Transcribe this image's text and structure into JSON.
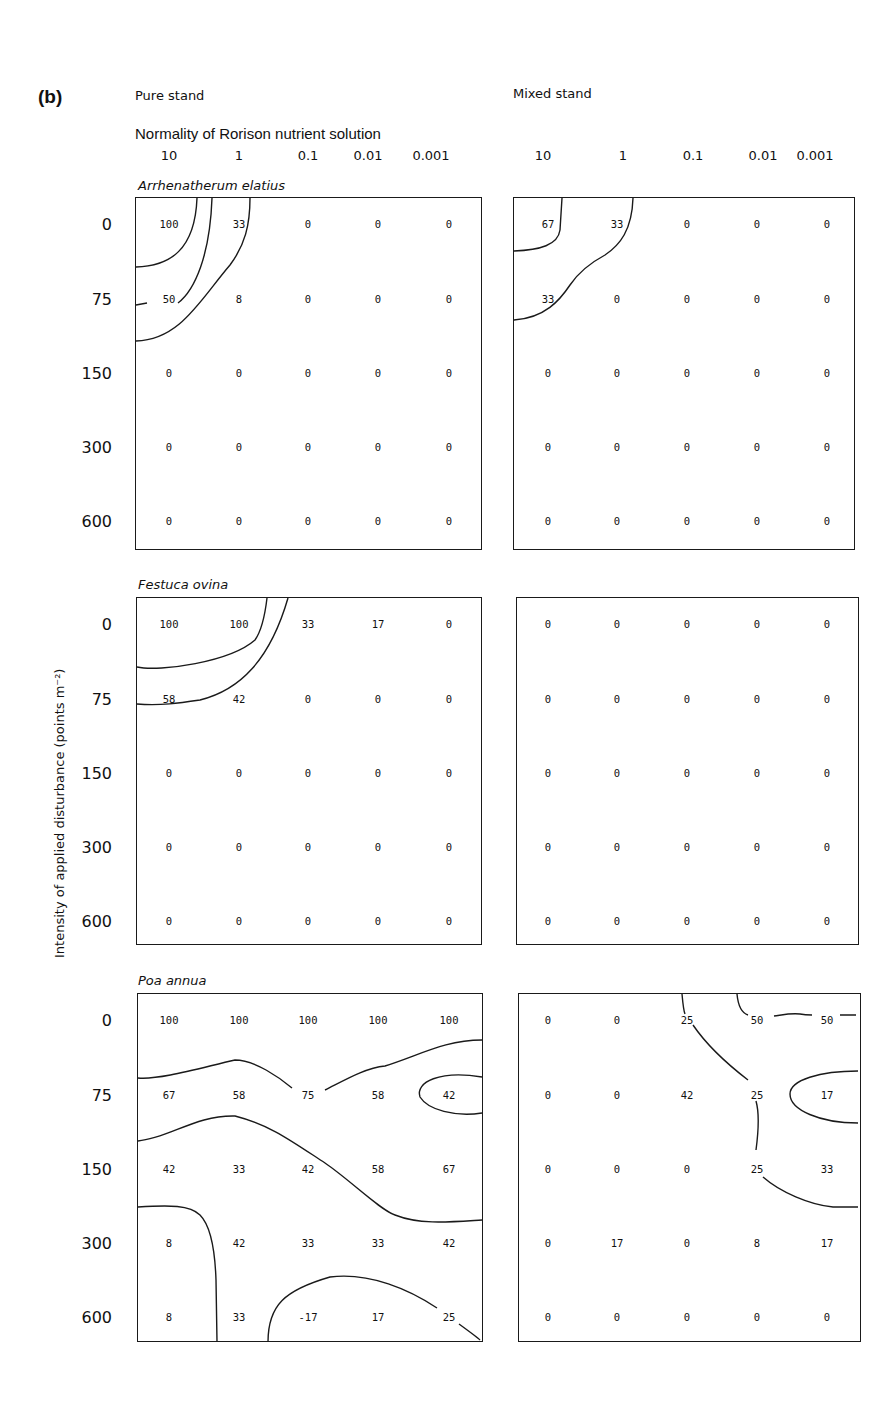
{
  "figure": {
    "panel_label": "(b)",
    "pure_title": "Pure stand",
    "mixed_title": "Mixed stand",
    "x_axis_title": "Normality of Rorison nutrient solution",
    "x_ticks": [
      "10",
      "1",
      "0.1",
      "0.01",
      "0.001"
    ],
    "y_axis_title": "Intensity of applied disturbance (points m⁻²)",
    "y_ticks": [
      "0",
      "75",
      "150",
      "300",
      "600"
    ],
    "species": [
      "Arrhenatherum elatius",
      "Festuca ovina",
      "Poa annua"
    ]
  },
  "chart_data": {
    "type": "heatmap",
    "title": "",
    "xlabel": "Normality of Rorison nutrient solution",
    "ylabel": "Intensity of applied disturbance (points m^-2)",
    "x": [
      "10",
      "1",
      "0.1",
      "0.01",
      "0.001"
    ],
    "y": [
      "0",
      "75",
      "150",
      "300",
      "600"
    ],
    "note": "Contour maps of values in a 5x5 grid for each species under pure and mixed stands; contour lines drawn between values.",
    "panels": [
      {
        "species": "Arrhenatherum elatius",
        "pure": [
          [
            "100",
            "33",
            "0",
            "0",
            "0"
          ],
          [
            "50",
            "8",
            "0",
            "0",
            "0"
          ],
          [
            "0",
            "0",
            "0",
            "0",
            "0"
          ],
          [
            "0",
            "0",
            "0",
            "0",
            "0"
          ],
          [
            "0",
            "0",
            "0",
            "0",
            "0"
          ]
        ],
        "mixed": [
          [
            "67",
            "33",
            "0",
            "0",
            "0"
          ],
          [
            "33",
            "0",
            "0",
            "0",
            "0"
          ],
          [
            "0",
            "0",
            "0",
            "0",
            "0"
          ],
          [
            "0",
            "0",
            "0",
            "0",
            "0"
          ],
          [
            "0",
            "0",
            "0",
            "0",
            "0"
          ]
        ]
      },
      {
        "species": "Festuca ovina",
        "pure": [
          [
            "100",
            "100",
            "33",
            "17",
            "0"
          ],
          [
            "58",
            "42",
            "0",
            "0",
            "0"
          ],
          [
            "0",
            "0",
            "0",
            "0",
            "0"
          ],
          [
            "0",
            "0",
            "0",
            "0",
            "0"
          ],
          [
            "0",
            "0",
            "0",
            "0",
            "0"
          ]
        ],
        "mixed": [
          [
            "0",
            "0",
            "0",
            "0",
            "0"
          ],
          [
            "0",
            "0",
            "0",
            "0",
            "0"
          ],
          [
            "0",
            "0",
            "0",
            "0",
            "0"
          ],
          [
            "0",
            "0",
            "0",
            "0",
            "0"
          ],
          [
            "0",
            "0",
            "0",
            "0",
            "0"
          ]
        ]
      },
      {
        "species": "Poa annua",
        "pure": [
          [
            "100",
            "100",
            "100",
            "100",
            "100"
          ],
          [
            "67",
            "58",
            "75",
            "58",
            "42"
          ],
          [
            "42",
            "33",
            "42",
            "58",
            "67"
          ],
          [
            "8",
            "42",
            "33",
            "33",
            "42"
          ],
          [
            "8",
            "33",
            "-17",
            "17",
            "25"
          ]
        ],
        "mixed": [
          [
            "0",
            "0",
            "25",
            "50",
            "50"
          ],
          [
            "0",
            "0",
            "42",
            "25",
            "17"
          ],
          [
            "0",
            "0",
            "0",
            "25",
            "33"
          ],
          [
            "0",
            "17",
            "0",
            "8",
            "17"
          ],
          [
            "0",
            "0",
            "0",
            "0",
            "0"
          ]
        ]
      }
    ],
    "contour_labels": {
      "Arrhenatherum elatius": {
        "pure": [
          "50"
        ]
      },
      "Poa annua": {
        "mixed": [
          "50",
          "50"
        ]
      }
    }
  }
}
